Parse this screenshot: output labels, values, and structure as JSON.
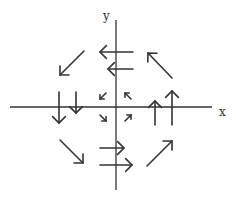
{
  "diagram": {
    "type": "vector-field",
    "axes": {
      "x_label": "x",
      "y_label": "y",
      "origin": [
        116,
        107
      ]
    },
    "arrows": [
      {
        "name": "arrow-left-top",
        "from": [
          133,
          52
        ],
        "to": [
          100,
          52
        ],
        "direction": "left"
      },
      {
        "name": "arrow-left-mid",
        "from": [
          133,
          69
        ],
        "to": [
          108,
          69
        ],
        "direction": "left"
      },
      {
        "name": "arrow-right-mid",
        "from": [
          100,
          148
        ],
        "to": [
          124,
          148
        ],
        "direction": "right"
      },
      {
        "name": "arrow-right-bottom",
        "from": [
          100,
          165
        ],
        "to": [
          132,
          165
        ],
        "direction": "right"
      },
      {
        "name": "arrow-down-far",
        "from": [
          59,
          92
        ],
        "to": [
          59,
          123
        ],
        "direction": "down"
      },
      {
        "name": "arrow-down-near",
        "from": [
          76,
          92
        ],
        "to": [
          76,
          113
        ],
        "direction": "down"
      },
      {
        "name": "arrow-up-near",
        "from": [
          155,
          125
        ],
        "to": [
          155,
          101
        ],
        "direction": "up"
      },
      {
        "name": "arrow-up-far",
        "from": [
          172,
          125
        ],
        "to": [
          172,
          91
        ],
        "direction": "up"
      },
      {
        "name": "arrow-southwest",
        "from": [
          84,
          51
        ],
        "to": [
          60,
          75
        ],
        "direction": "southwest"
      },
      {
        "name": "arrow-northwest",
        "from": [
          172,
          78
        ],
        "to": [
          148,
          53
        ],
        "direction": "northwest"
      },
      {
        "name": "arrow-southeast",
        "from": [
          60,
          140
        ],
        "to": [
          83,
          163
        ],
        "direction": "southeast"
      },
      {
        "name": "arrow-northeast",
        "from": [
          147,
          166
        ],
        "to": [
          172,
          141
        ],
        "direction": "northeast"
      },
      {
        "name": "arrow-small-southwest",
        "from": [
          106,
          93
        ],
        "to": [
          100,
          99
        ],
        "direction": "southwest"
      },
      {
        "name": "arrow-small-northwest",
        "from": [
          131,
          99
        ],
        "to": [
          125,
          93
        ],
        "direction": "northwest"
      },
      {
        "name": "arrow-small-southeast",
        "from": [
          100,
          115
        ],
        "to": [
          106,
          121
        ],
        "direction": "southeast"
      },
      {
        "name": "arrow-small-northeast",
        "from": [
          125,
          121
        ],
        "to": [
          131,
          115
        ],
        "direction": "northeast"
      }
    ]
  }
}
